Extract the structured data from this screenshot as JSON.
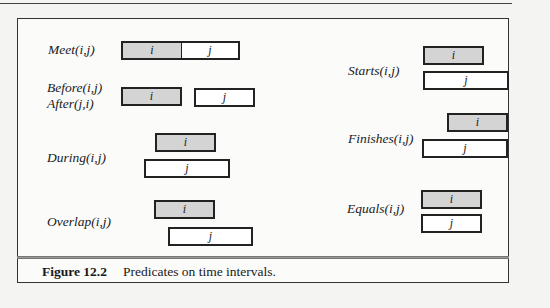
{
  "figure": {
    "caption_number": "Figure 12.2",
    "caption_text": "Predicates on time intervals."
  },
  "predicates": {
    "meet": {
      "label": "Meet(i,j)",
      "i": "i",
      "j": "j"
    },
    "before": {
      "label": "Before(i,j)",
      "label2": "After(j,i)",
      "i": "i",
      "j": "j"
    },
    "during": {
      "label": "During(i,j)",
      "i": "i",
      "j": "j"
    },
    "overlap": {
      "label": "Overlap(i,j)",
      "i": "i",
      "j": "j"
    },
    "starts": {
      "label": "Starts(i,j)",
      "i": "i",
      "j": "j"
    },
    "finishes": {
      "label": "Finishes(i,j)",
      "i": "i",
      "j": "j"
    },
    "equals": {
      "label": "Equals(i,j)",
      "i": "i",
      "j": "j"
    }
  },
  "colors": {
    "interval_i_fill": "#d4d4d4",
    "interval_j_fill": "#ffffff",
    "border": "#222222"
  }
}
